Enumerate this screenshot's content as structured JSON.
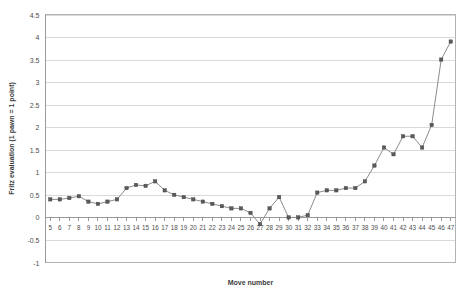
{
  "chart_data": {
    "type": "line",
    "title": "",
    "xlabel": "Move number",
    "ylabel": "Fritz evaluation (1 pawn = 1 point)",
    "xlim": [
      4.5,
      47.5
    ],
    "ylim": [
      -1,
      4.5
    ],
    "grid": true,
    "legend": false,
    "marker": "square",
    "series_color": "#8c8c8c",
    "marker_color": "#5a5a5a",
    "gridline_color": "#d9d9d9",
    "frame_color": "#b3b3b3",
    "ytick_labels": [
      "4.5",
      "4",
      "3.5",
      "3",
      "2.5",
      "2",
      "1.5",
      "1",
      "0.5",
      "0",
      "-0.5",
      "-1"
    ],
    "ytick_values": [
      4.5,
      4,
      3.5,
      3,
      2.5,
      2,
      1.5,
      1,
      0.5,
      0,
      -0.5,
      -1
    ],
    "categories": [
      5,
      6,
      7,
      8,
      9,
      10,
      11,
      12,
      13,
      14,
      15,
      16,
      17,
      18,
      19,
      20,
      21,
      22,
      23,
      24,
      25,
      26,
      27,
      28,
      29,
      30,
      31,
      32,
      33,
      34,
      35,
      36,
      37,
      38,
      39,
      40,
      41,
      42,
      43,
      44,
      45,
      46,
      47
    ],
    "xtick_labels": [
      "5",
      "6",
      "7",
      "8",
      "9",
      "10",
      "11",
      "12",
      "13",
      "14",
      "15",
      "16",
      "17",
      "18",
      "19",
      "20",
      "21",
      "22",
      "23",
      "24",
      "25",
      "26",
      "27",
      "28",
      "29",
      "30",
      "31",
      "32",
      "33",
      "34",
      "35",
      "36",
      "37",
      "38",
      "39",
      "40",
      "41",
      "42",
      "43",
      "44",
      "45",
      "46",
      "47"
    ],
    "values": [
      0.4,
      0.4,
      0.43,
      0.47,
      0.35,
      0.3,
      0.35,
      0.4,
      0.65,
      0.72,
      0.7,
      0.8,
      0.6,
      0.5,
      0.45,
      0.4,
      0.35,
      0.3,
      0.25,
      0.2,
      0.2,
      0.1,
      -0.15,
      0.2,
      0.45,
      0.0,
      0.0,
      0.05,
      0.55,
      0.6,
      0.6,
      0.65,
      0.65,
      0.8,
      1.15,
      1.55,
      1.4,
      1.8,
      1.8,
      1.55,
      2.05,
      3.5,
      3.9
    ]
  },
  "axis": {
    "ylabel": "Fritz evaluation (1 pawn = 1 point)",
    "xlabel": "Move number"
  }
}
